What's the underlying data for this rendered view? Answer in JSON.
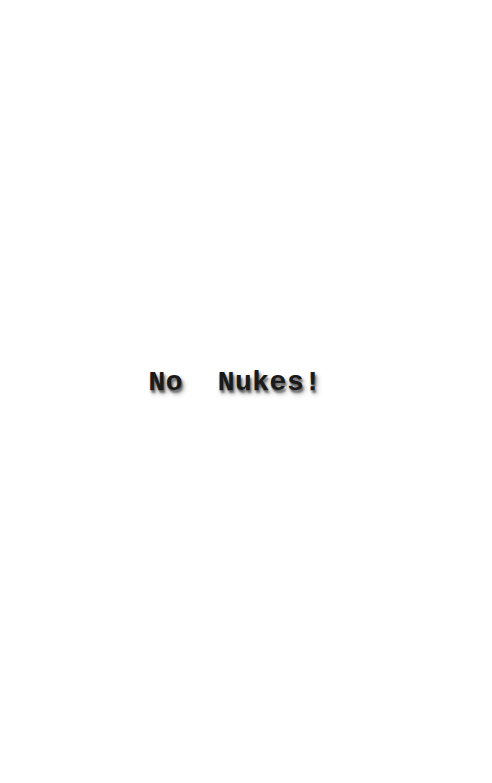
{
  "page": {
    "background_color": "#ffffff",
    "width": 492,
    "height": 783
  },
  "content": {
    "slogan": "No  Nukes!",
    "text_color": "#1a1a1a",
    "shadow_color": "#3c3c3c"
  }
}
